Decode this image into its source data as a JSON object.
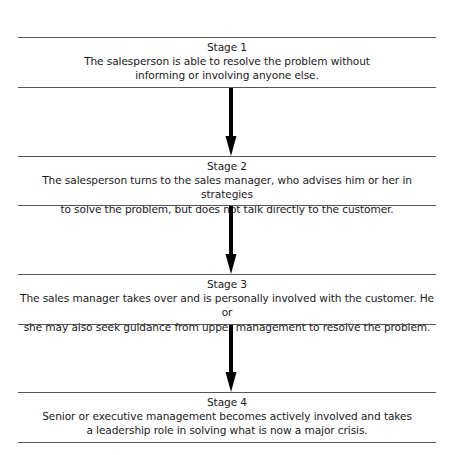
{
  "diagram": {
    "type": "vertical-flowchart",
    "stages": [
      {
        "title": "Stage 1",
        "lines": [
          "The salesperson is able to resolve the problem without",
          "informing or involving anyone else."
        ]
      },
      {
        "title": "Stage 2",
        "lines": [
          "The salesperson turns to the sales manager, who advises him or her in strategies",
          "to solve the problem, but does not talk directly to the customer."
        ]
      },
      {
        "title": "Stage 3",
        "lines": [
          "The sales manager takes over and is personally involved with the customer. He or",
          "she may also seek guidance from upper management to resolve the problem."
        ]
      },
      {
        "title": "Stage 4",
        "lines": [
          "Senior or executive management becomes actively involved and takes",
          "a leadership role in solving what is now a major crisis."
        ]
      }
    ],
    "arrows": [
      {
        "from": "Stage 1",
        "to": "Stage 2",
        "icon": "down-arrow-icon"
      },
      {
        "from": "Stage 2",
        "to": "Stage 3",
        "icon": "down-arrow-icon"
      },
      {
        "from": "Stage 3",
        "to": "Stage 4",
        "icon": "down-arrow-icon"
      }
    ],
    "colors": {
      "rule": "#555555",
      "arrow": "#000000",
      "text": "#1a1a1a"
    }
  }
}
